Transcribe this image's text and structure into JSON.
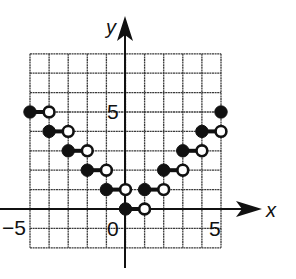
{
  "chart_data": {
    "type": "step",
    "title": "",
    "xlabel": "x",
    "ylabel": "y",
    "xlim": [
      -5,
      5
    ],
    "ylim": [
      -2,
      8
    ],
    "grid": true,
    "x_tick_labels": [
      {
        "value": -5,
        "label": "−5"
      },
      {
        "value": 0,
        "label": "0"
      },
      {
        "value": 5,
        "label": "5"
      }
    ],
    "y_tick_labels": [
      {
        "value": 5,
        "label": "5"
      }
    ],
    "segments": [
      {
        "x_start": -5,
        "x_end": -4,
        "y": 5,
        "start": "closed",
        "end": "open"
      },
      {
        "x_start": -4,
        "x_end": -3,
        "y": 4,
        "start": "closed",
        "end": "open"
      },
      {
        "x_start": -3,
        "x_end": -2,
        "y": 3,
        "start": "closed",
        "end": "open"
      },
      {
        "x_start": -2,
        "x_end": -1,
        "y": 2,
        "start": "closed",
        "end": "open"
      },
      {
        "x_start": -1,
        "x_end": 0,
        "y": 1,
        "start": "closed",
        "end": "open"
      },
      {
        "x_start": 0,
        "x_end": 1,
        "y": 0,
        "start": "closed",
        "end": "open"
      },
      {
        "x_start": 1,
        "x_end": 2,
        "y": 1,
        "start": "closed",
        "end": "open"
      },
      {
        "x_start": 2,
        "x_end": 3,
        "y": 2,
        "start": "closed",
        "end": "open"
      },
      {
        "x_start": 3,
        "x_end": 4,
        "y": 3,
        "start": "closed",
        "end": "open"
      },
      {
        "x_start": 4,
        "x_end": 5,
        "y": 4,
        "start": "closed",
        "end": "open"
      }
    ],
    "isolated_points": [
      {
        "x": 5,
        "y": 5,
        "style": "closed"
      }
    ],
    "colors": {
      "ink": "#111111",
      "grid": "#3a3a3a",
      "background": "#ffffff"
    }
  }
}
